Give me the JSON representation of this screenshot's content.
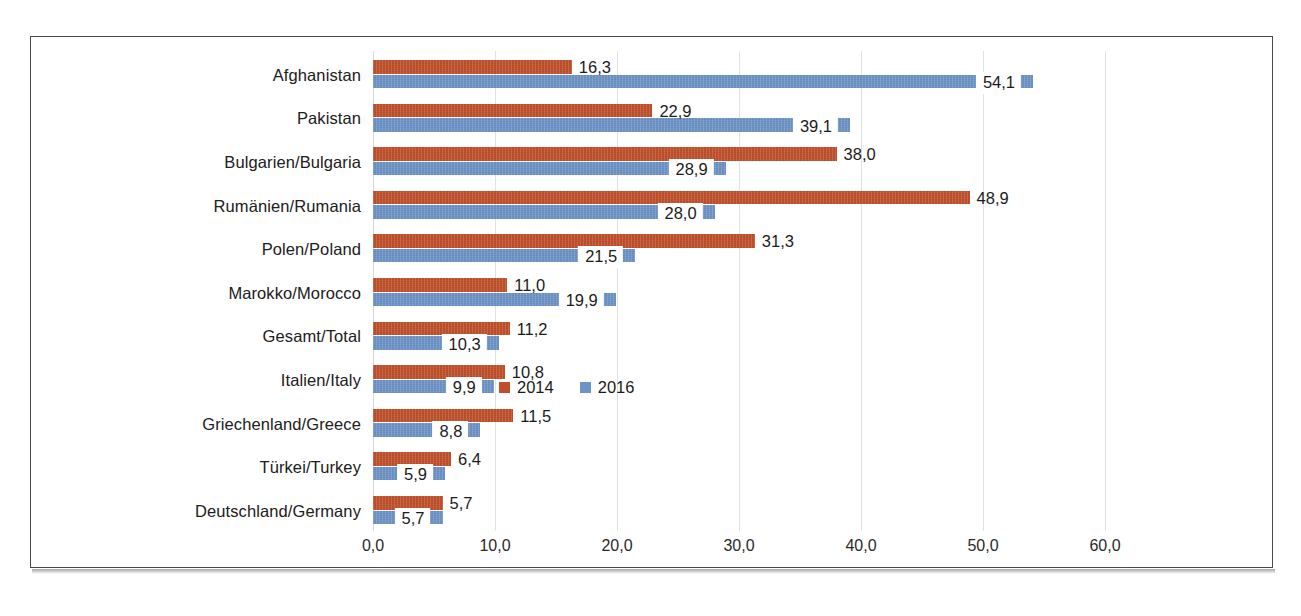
{
  "chart_data": {
    "type": "bar",
    "orientation": "horizontal",
    "title": "",
    "xlabel": "",
    "ylabel": "",
    "xlim": [
      0,
      63
    ],
    "grid": true,
    "legend_position": "center-right",
    "decimal_separator": ",",
    "categories": [
      "Afghanistan",
      "Pakistan",
      "Bulgarien/Bulgaria",
      "Rumänien/Rumania",
      "Polen/Poland",
      "Marokko/Morocco",
      "Gesamt/Total",
      "Italien/Italy",
      "Griechenland/Greece",
      "Türkei/Turkey",
      "Deutschland/Germany"
    ],
    "xticks": [
      "0,0",
      "10,0",
      "20,0",
      "30,0",
      "40,0",
      "50,0",
      "60,0"
    ],
    "xtick_values": [
      0,
      10,
      20,
      30,
      40,
      50,
      60
    ],
    "series": [
      {
        "name": "2014",
        "color": "#C0502B",
        "values": [
          16.3,
          22.9,
          38.0,
          48.9,
          31.3,
          11.0,
          11.2,
          10.8,
          11.5,
          6.4,
          5.7
        ],
        "labels": [
          "16,3",
          "22,9",
          "38,0",
          "48,9",
          "31,3",
          "11,0",
          "11,2",
          "10,8",
          "11,5",
          "6,4",
          "5,7"
        ]
      },
      {
        "name": "2016",
        "color": "#6E93C6",
        "values": [
          54.1,
          39.1,
          28.9,
          28.0,
          21.5,
          19.9,
          10.3,
          9.9,
          8.8,
          5.9,
          5.7
        ],
        "labels": [
          "54,1",
          "39,1",
          "28,9",
          "28,0",
          "21,5",
          "19,9",
          "10,3",
          "9,9",
          "8,8",
          "5,9",
          "5,7"
        ]
      }
    ]
  },
  "legend": {
    "items": [
      {
        "label": "2014",
        "color": "#C0502B"
      },
      {
        "label": "2016",
        "color": "#6E93C6"
      }
    ]
  },
  "caption": {
    "text": ""
  }
}
